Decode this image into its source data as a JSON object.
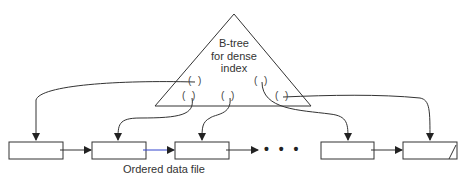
{
  "btree": {
    "label_line1": "B-tree",
    "label_line2": "for dense",
    "label_line3": "index",
    "pointer_slots": [
      "( )",
      "( )",
      "( )",
      "( )",
      "( )"
    ]
  },
  "data_file": {
    "caption": "Ordered data file",
    "ellipsis": "• • •",
    "blocks": [
      {
        "id": "block-1"
      },
      {
        "id": "block-2"
      },
      {
        "id": "block-3"
      },
      {
        "id": "block-4"
      },
      {
        "id": "block-5",
        "last": true
      }
    ]
  },
  "colors": {
    "stroke": "#333333",
    "link_highlight": "#3344cc"
  }
}
